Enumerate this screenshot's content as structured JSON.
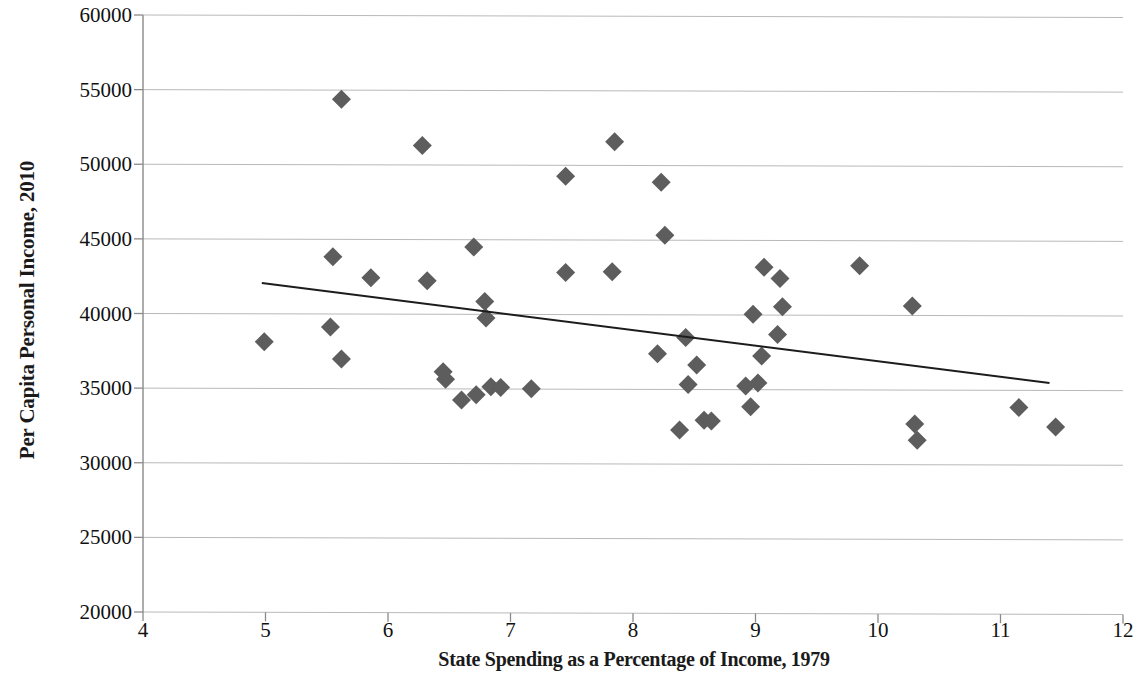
{
  "chart_data": {
    "type": "scatter",
    "title": "",
    "xlabel": "State Spending as a Percentage of Income, 1979",
    "ylabel": "Per Capita Personal Income, 2010",
    "xlim": [
      4,
      12
    ],
    "ylim": [
      20000,
      60000
    ],
    "xticks": [
      "4",
      "5",
      "6",
      "7",
      "8",
      "9",
      "10",
      "11",
      "12"
    ],
    "yticks": [
      "20000",
      "25000",
      "30000",
      "35000",
      "40000",
      "45000",
      "50000",
      "55000",
      "60000"
    ],
    "grid": "horizontal",
    "legend": "none",
    "marker_shape": "diamond",
    "marker_color": "#5d5d5d",
    "trendline_color": "#1c1c1c",
    "gridline_color": "#b9b9b9",
    "axis_color": "#8a8a8a",
    "points": [
      {
        "x": 4.99,
        "y": 38100
      },
      {
        "x": 5.53,
        "y": 39100
      },
      {
        "x": 5.55,
        "y": 43800
      },
      {
        "x": 5.62,
        "y": 54350
      },
      {
        "x": 5.62,
        "y": 36950
      },
      {
        "x": 5.86,
        "y": 42400
      },
      {
        "x": 6.28,
        "y": 51250
      },
      {
        "x": 6.32,
        "y": 42200
      },
      {
        "x": 6.45,
        "y": 36100
      },
      {
        "x": 6.47,
        "y": 35600
      },
      {
        "x": 6.6,
        "y": 34200
      },
      {
        "x": 6.7,
        "y": 44450
      },
      {
        "x": 6.72,
        "y": 34550
      },
      {
        "x": 6.79,
        "y": 40800
      },
      {
        "x": 6.8,
        "y": 39700
      },
      {
        "x": 6.84,
        "y": 35100
      },
      {
        "x": 6.92,
        "y": 35050
      },
      {
        "x": 7.17,
        "y": 34950
      },
      {
        "x": 7.45,
        "y": 42750
      },
      {
        "x": 7.45,
        "y": 49200
      },
      {
        "x": 7.83,
        "y": 42800
      },
      {
        "x": 7.85,
        "y": 51500
      },
      {
        "x": 8.2,
        "y": 37300
      },
      {
        "x": 8.23,
        "y": 48800
      },
      {
        "x": 8.26,
        "y": 45250
      },
      {
        "x": 8.38,
        "y": 32200
      },
      {
        "x": 8.43,
        "y": 38400
      },
      {
        "x": 8.45,
        "y": 35250
      },
      {
        "x": 8.52,
        "y": 36550
      },
      {
        "x": 8.58,
        "y": 32850
      },
      {
        "x": 8.64,
        "y": 32800
      },
      {
        "x": 8.92,
        "y": 35150
      },
      {
        "x": 8.96,
        "y": 33750
      },
      {
        "x": 8.98,
        "y": 39950
      },
      {
        "x": 9.02,
        "y": 35350
      },
      {
        "x": 9.05,
        "y": 37150
      },
      {
        "x": 9.07,
        "y": 43100
      },
      {
        "x": 9.18,
        "y": 38600
      },
      {
        "x": 9.2,
        "y": 42350
      },
      {
        "x": 9.22,
        "y": 40450
      },
      {
        "x": 9.85,
        "y": 43200
      },
      {
        "x": 10.28,
        "y": 40500
      },
      {
        "x": 10.3,
        "y": 32600
      },
      {
        "x": 10.32,
        "y": 31500
      },
      {
        "x": 11.15,
        "y": 33700
      },
      {
        "x": 11.45,
        "y": 32400
      }
    ],
    "trendline": {
      "x0": 4.97,
      "y0": 42050,
      "x1": 11.4,
      "y1": 35350
    }
  }
}
